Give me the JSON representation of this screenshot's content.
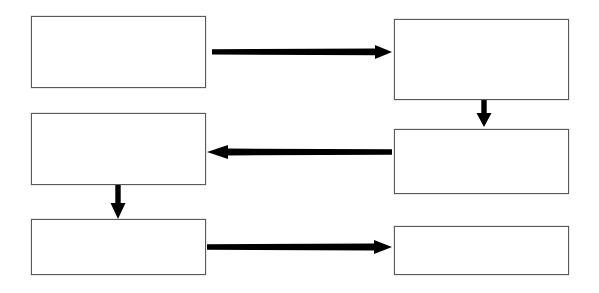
{
  "diagram": {
    "title": "",
    "background_color": "#ffffff",
    "box_border_color": "#5a5a5a",
    "arrow_color": "#000000",
    "nodes": [
      {
        "id": "node-top-left",
        "label": "",
        "x": 31,
        "y": 16,
        "w": 175,
        "h": 72
      },
      {
        "id": "node-top-right",
        "label": "",
        "x": 394,
        "y": 19,
        "w": 175,
        "h": 81
      },
      {
        "id": "node-middle-left",
        "label": "",
        "x": 31,
        "y": 113,
        "w": 175,
        "h": 72
      },
      {
        "id": "node-middle-right",
        "label": "",
        "x": 394,
        "y": 129,
        "w": 175,
        "h": 65
      },
      {
        "id": "node-bottom-left",
        "label": "",
        "x": 31,
        "y": 219,
        "w": 175,
        "h": 56
      },
      {
        "id": "node-bottom-right",
        "label": "",
        "x": 394,
        "y": 226,
        "w": 175,
        "h": 49
      }
    ],
    "edges": [
      {
        "id": "edge-top-left-to-top-right",
        "from": "node-top-left",
        "to": "node-top-right",
        "direction": "right",
        "label": ""
      },
      {
        "id": "edge-top-right-to-middle-right",
        "from": "node-top-right",
        "to": "node-middle-right",
        "direction": "down",
        "label": ""
      },
      {
        "id": "edge-middle-right-to-middle-left",
        "from": "node-middle-right",
        "to": "node-middle-left",
        "direction": "left",
        "label": ""
      },
      {
        "id": "edge-middle-left-to-bottom-left",
        "from": "node-middle-left",
        "to": "node-bottom-left",
        "direction": "down",
        "label": ""
      },
      {
        "id": "edge-bottom-left-to-bottom-right",
        "from": "node-bottom-left",
        "to": "node-bottom-right",
        "direction": "right",
        "label": ""
      }
    ]
  }
}
